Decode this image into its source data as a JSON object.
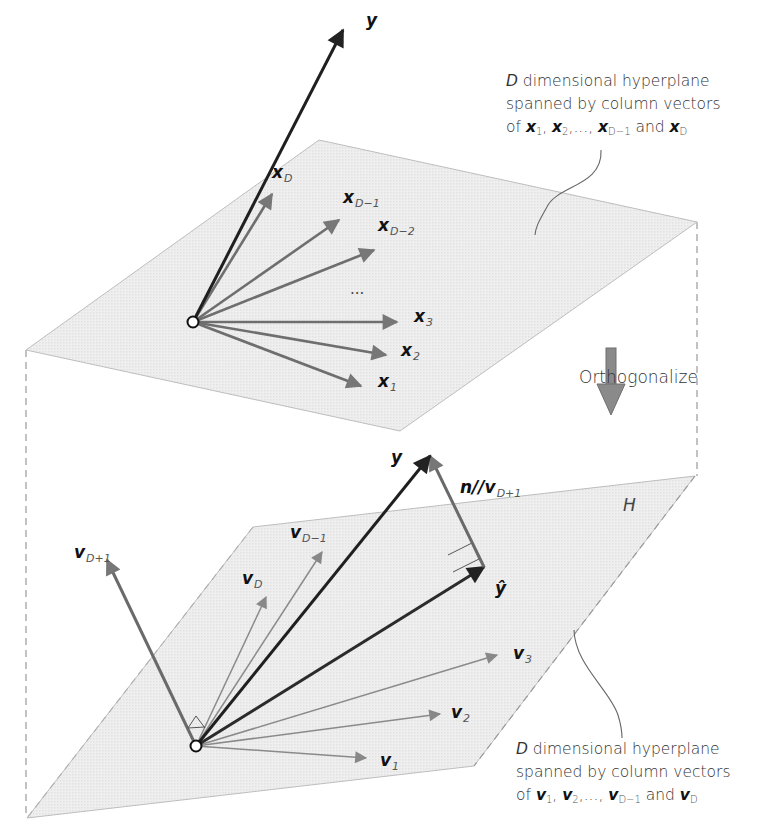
{
  "figure": {
    "type": "diagram",
    "description_visible": "Gram-Schmidt orthogonalization of a hyperplane's spanning vectors",
    "colors": {
      "plane_fill": "#ececec",
      "plane_edge": "#b8b8b8",
      "dash_line": "#999999",
      "y_vector": "#222222",
      "x_vectors": "#6e6e6e",
      "v_vectors": "#7a7a7a",
      "normal_vector": "#6a6a6a",
      "origin_fill": "#ffffff",
      "arrow_fill": "#888888"
    }
  },
  "top_plane": {
    "corners": [
      [
        319,
        140
      ],
      [
        697,
        222
      ],
      [
        400,
        431
      ],
      [
        26,
        350
      ]
    ],
    "origin": [
      193,
      322
    ],
    "y_vector": {
      "label": "y",
      "tip": [
        343,
        30
      ]
    },
    "vectors": [
      {
        "id": "x_D",
        "base": "x",
        "sub": "D",
        "tip": [
          272,
          194
        ],
        "label_pos": [
          272,
          172
        ]
      },
      {
        "id": "x_D-1",
        "base": "x",
        "sub": "D−1",
        "tip": [
          339,
          220
        ],
        "label_pos": [
          343,
          197
        ]
      },
      {
        "id": "x_D-2",
        "base": "x",
        "sub": "D−2",
        "tip": [
          374,
          250
        ],
        "label_pos": [
          378,
          225
        ]
      },
      {
        "id": "x_3",
        "base": "x",
        "sub": "3",
        "tip": [
          397,
          322
        ],
        "label_pos": [
          414,
          316
        ]
      },
      {
        "id": "x_2",
        "base": "x",
        "sub": "2",
        "tip": [
          386,
          355
        ],
        "label_pos": [
          401,
          350
        ]
      },
      {
        "id": "x_1",
        "base": "x",
        "sub": "1",
        "tip": [
          361,
          386
        ],
        "label_pos": [
          378,
          381
        ]
      }
    ],
    "ellipsis": {
      "text": "...",
      "pos": [
        350,
        287
      ]
    },
    "annotation": {
      "line1_italic": "D",
      "line1": " dimensional hyperplane",
      "line2": "spanned by column vectors",
      "line3_prefix": "of ",
      "v1": "x",
      "s1": "1",
      "v2": "x",
      "s2": "2",
      "ellipsis": ",..., ",
      "v3": "x",
      "s3": "D−1",
      "and": " and ",
      "v4": "x",
      "s4": "D",
      "pos": [
        506,
        72
      ]
    }
  },
  "transition": {
    "label": "Orthogonalize",
    "arrow_pos": [
      606,
      348
    ]
  },
  "bottom_plane": {
    "label": "H",
    "corners": [
      [
        253,
        527
      ],
      [
        695,
        476
      ],
      [
        474,
        766
      ],
      [
        27,
        818
      ]
    ],
    "origin": [
      196,
      746
    ],
    "y_vector": {
      "label": "y",
      "tip": [
        430,
        456
      ]
    },
    "y_hat": {
      "label": "ŷ",
      "tip": [
        484,
        567
      ],
      "label_pos": [
        495,
        592
      ]
    },
    "normal": {
      "label_prefix": "n//",
      "label_base": "v",
      "label_sub": "D+1",
      "pos": [
        461,
        478
      ]
    },
    "vectors": [
      {
        "id": "v_D+1",
        "base": "v",
        "sub": "D+1",
        "tip": [
          107,
          560
        ],
        "label_pos": [
          74,
          552
        ]
      },
      {
        "id": "v_D-1",
        "base": "v",
        "sub": "D−1",
        "tip": [
          322,
          552
        ],
        "label_pos": [
          290,
          532
        ]
      },
      {
        "id": "v_D",
        "base": "v",
        "sub": "D",
        "tip": [
          266,
          597
        ],
        "label_pos": [
          242,
          578
        ]
      },
      {
        "id": "v_3",
        "base": "v",
        "sub": "3",
        "tip": [
          497,
          655
        ],
        "label_pos": [
          513,
          653
        ]
      },
      {
        "id": "v_2",
        "base": "v",
        "sub": "2",
        "tip": [
          440,
          714
        ],
        "label_pos": [
          451,
          712
        ]
      },
      {
        "id": "v_1",
        "base": "v",
        "sub": "1",
        "tip": [
          366,
          758
        ],
        "label_pos": [
          380,
          760
        ]
      }
    ],
    "annotation": {
      "line1_italic": "D",
      "line1": " dimensional hyperplane",
      "line2": "spanned by column vectors",
      "line3_prefix": "of ",
      "v1": "v",
      "s1": "1",
      "v2": "v",
      "s2": "2",
      "ellipsis": ",..., ",
      "v3": "v",
      "s3": "D−1",
      "and": " and ",
      "v4": "v",
      "s4": "D",
      "pos": [
        516,
        738
      ]
    }
  }
}
